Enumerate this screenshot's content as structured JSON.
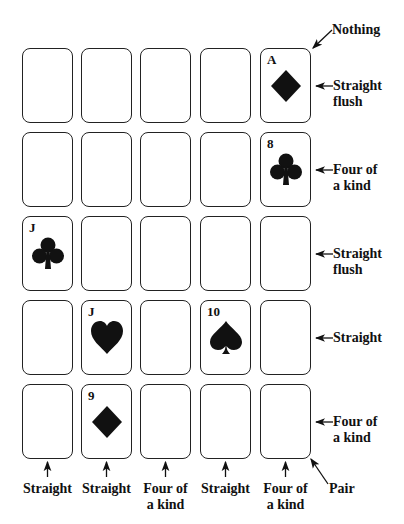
{
  "figure": {
    "grid": {
      "rows": 5,
      "cols": 5,
      "cards": [
        {
          "row": 0,
          "col": 4,
          "rank": "A",
          "suit": "diamond"
        },
        {
          "row": 1,
          "col": 4,
          "rank": "8",
          "suit": "club"
        },
        {
          "row": 2,
          "col": 0,
          "rank": "J",
          "suit": "club"
        },
        {
          "row": 3,
          "col": 1,
          "rank": "J",
          "suit": "heart"
        },
        {
          "row": 3,
          "col": 3,
          "rank": "10",
          "suit": "spade"
        },
        {
          "row": 4,
          "col": 1,
          "rank": "9",
          "suit": "diamond"
        }
      ]
    },
    "row_labels": [
      {
        "line1": "Straight",
        "line2": "flush"
      },
      {
        "line1": "Four of",
        "line2": "a kind"
      },
      {
        "line1": "Straight",
        "line2": "flush"
      },
      {
        "line1": "Straight",
        "line2": ""
      },
      {
        "line1": "Four of",
        "line2": "a kind"
      }
    ],
    "column_labels": [
      {
        "line1": "Straight",
        "line2": ""
      },
      {
        "line1": "Straight",
        "line2": ""
      },
      {
        "line1": "Four of",
        "line2": "a kind"
      },
      {
        "line1": "Straight",
        "line2": ""
      },
      {
        "line1": "Four of",
        "line2": "a kind"
      }
    ],
    "diagonal_labels": {
      "anti_diagonal": "Nothing",
      "main_diagonal": "Pair"
    }
  }
}
